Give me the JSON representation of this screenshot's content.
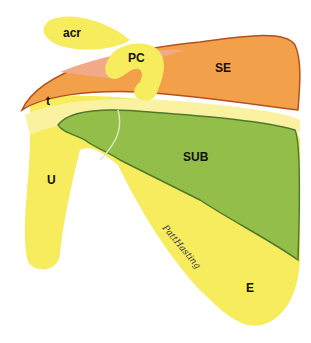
{
  "diagram": {
    "labels": {
      "acromion": "acr",
      "coracoid": "PC",
      "supraspinous": "SE",
      "tubercle": "t",
      "subscapular": "SUB",
      "upper": "U",
      "lower": "E"
    },
    "signature": "PattHasting",
    "colors": {
      "yellow": "#f7ec5e",
      "yellow_light": "#faf2a0",
      "orange": "#f3a04a",
      "orange_light": "#f2a98a",
      "orange_outline": "#b5501c",
      "green": "#93be4a",
      "green_outline": "#4f7a2a",
      "background": "#ffffff"
    }
  }
}
